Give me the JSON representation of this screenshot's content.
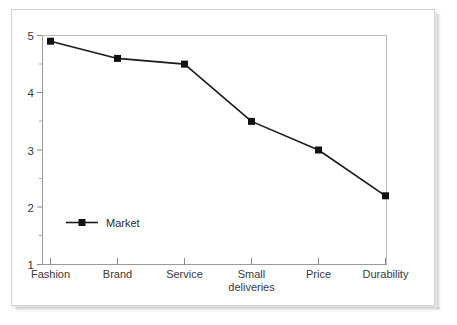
{
  "chart_data": {
    "type": "line",
    "title": "",
    "subtitle": "",
    "xlabel": "",
    "ylabel": "",
    "categories": [
      "Fashion",
      "Brand",
      "Service",
      "Small deliveries",
      "Price",
      "Durability"
    ],
    "category_lines": [
      [
        "Fashion"
      ],
      [
        "Brand"
      ],
      [
        "Service"
      ],
      [
        "Small",
        "deliveries"
      ],
      [
        "Price"
      ],
      [
        "Durability"
      ]
    ],
    "series": [
      {
        "name": "Market",
        "values": [
          4.9,
          4.6,
          4.5,
          3.5,
          3.0,
          2.2
        ],
        "color": "#1a1a1a",
        "marker": "square"
      }
    ],
    "ylim": [
      1,
      5
    ],
    "ytick_labels": [
      "1",
      "2",
      "3",
      "4",
      "5"
    ],
    "ytick_values": [
      1,
      2,
      3,
      4,
      5
    ],
    "yminor_values": [
      1.5,
      2.5,
      3.5,
      4.5
    ],
    "grid": false,
    "legend": {
      "position": "inside-bottom-left",
      "entries": [
        "Market"
      ]
    }
  },
  "legend": {
    "market_label": "Market"
  },
  "axes": {
    "y_labels": [
      "5",
      "4",
      "3",
      "2",
      "1"
    ],
    "x_labels": [
      "Fashion",
      "Brand",
      "Service",
      "Small",
      "deliveries",
      "Price",
      "Durability"
    ]
  }
}
